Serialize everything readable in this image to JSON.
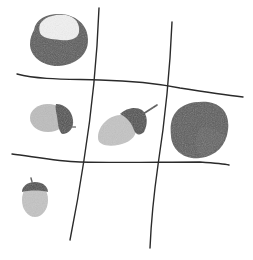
{
  "scene": {
    "title": "Tic-tac-toe board with chestnuts and acorns",
    "description": "Hand-drawn 3x3 grid; pieces are chestnuts and acorns placed in cells",
    "colors": {
      "background": "#ffffff",
      "grid_line": "#2a2a2a",
      "chestnut_dark": "#5a5a5a",
      "chestnut_shade": "#4a4a4a",
      "chestnut_light": "#f2f2f2",
      "acorn_cap": "#505050",
      "acorn_body": "#bdbdbd",
      "acorn_body_light": "#cfcfcf"
    },
    "grid": {
      "rows": 3,
      "cols": 3
    },
    "pieces": [
      {
        "cell": "top-left",
        "type": "chestnut"
      },
      {
        "cell": "middle-left",
        "type": "acorn"
      },
      {
        "cell": "center",
        "type": "acorn"
      },
      {
        "cell": "middle-right",
        "type": "chestnut"
      },
      {
        "cell": "bottom-left",
        "type": "acorn"
      }
    ]
  }
}
